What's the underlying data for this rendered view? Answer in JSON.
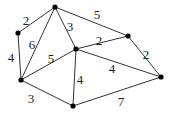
{
  "graph": {
    "nodes": [
      {
        "id": "A",
        "x": 55,
        "y": 7
      },
      {
        "id": "B",
        "x": 18,
        "y": 33
      },
      {
        "id": "C",
        "x": 21,
        "y": 80
      },
      {
        "id": "D",
        "x": 76,
        "y": 49
      },
      {
        "id": "E",
        "x": 128,
        "y": 36
      },
      {
        "id": "F",
        "x": 161,
        "y": 77
      },
      {
        "id": "G",
        "x": 73,
        "y": 106
      }
    ],
    "edges": [
      {
        "from": "A",
        "to": "B",
        "weight": "2",
        "lx": 26,
        "ly": 22
      },
      {
        "from": "A",
        "to": "C",
        "weight": "6",
        "lx": 32,
        "ly": 46
      },
      {
        "from": "A",
        "to": "D",
        "weight": "3",
        "lx": 70,
        "ly": 28
      },
      {
        "from": "A",
        "to": "E",
        "weight": "5",
        "lx": 97,
        "ly": 16
      },
      {
        "from": "B",
        "to": "C",
        "weight": "4",
        "lx": 11,
        "ly": 59
      },
      {
        "from": "C",
        "to": "D",
        "weight": "5",
        "lx": 51,
        "ly": 60
      },
      {
        "from": "D",
        "to": "E",
        "weight": "2",
        "lx": 99,
        "ly": 42
      },
      {
        "from": "D",
        "to": "G",
        "weight": "4",
        "lx": 80,
        "ly": 81
      },
      {
        "from": "D",
        "to": "F",
        "weight": "4",
        "lx": 112,
        "ly": 70
      },
      {
        "from": "C",
        "to": "G",
        "weight": "3",
        "lx": 31,
        "ly": 100
      },
      {
        "from": "G",
        "to": "F",
        "weight": "7",
        "lx": 121,
        "ly": 103
      },
      {
        "from": "E",
        "to": "F",
        "weight": "2",
        "lx": 146,
        "ly": 56
      }
    ]
  }
}
